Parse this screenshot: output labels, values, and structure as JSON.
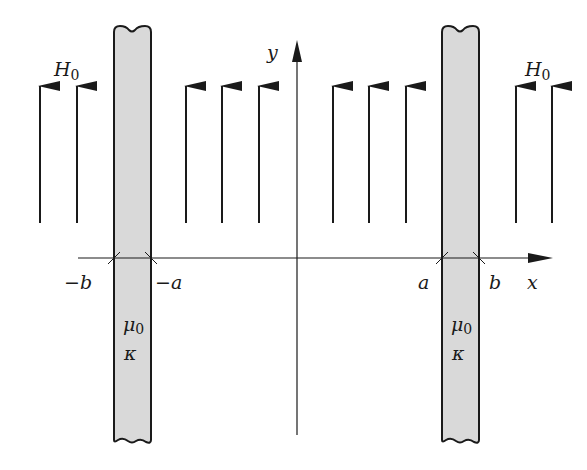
{
  "diagram": {
    "type": "physics-schematic",
    "colors": {
      "line": "#1a1a1a",
      "slab_fill": "#d9d9d9",
      "background": "#ffffff"
    },
    "axes": {
      "x_label": "x",
      "y_label": "y"
    },
    "field": {
      "label": "H",
      "subscript": "0",
      "arrow_count_outer_left": 2,
      "arrow_count_inner": 6,
      "arrow_count_outer_right": 2
    },
    "ticks": {
      "minus_b": "−b",
      "minus_a": "−a",
      "a": "a",
      "b": "b"
    },
    "slabs": [
      {
        "name": "left-slab",
        "permeability": "μ",
        "permeability_sub": "0",
        "conductivity": "κ"
      },
      {
        "name": "right-slab",
        "permeability": "μ",
        "permeability_sub": "0",
        "conductivity": "κ"
      }
    ]
  }
}
